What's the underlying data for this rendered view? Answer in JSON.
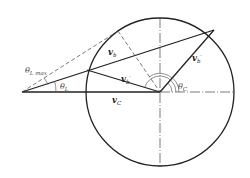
{
  "diagram": {
    "labels": {
      "theta_L_max": {
        "main": "θ",
        "sub": "L max"
      },
      "theta_L": {
        "main": "θ",
        "sub": "L"
      },
      "theta_C": {
        "main": "θ",
        "sub": "C"
      },
      "v_b": {
        "main": "v",
        "sub": "b"
      },
      "v_b_prime_inner": {
        "main": "v",
        "sub": "b",
        "prime": "′"
      },
      "v_b_prime_outer": {
        "main": "v",
        "sub": "b",
        "prime": "′"
      },
      "v_C": {
        "main": "v",
        "sub": "C"
      }
    },
    "colors": {
      "line": "#222222",
      "dash": "#555555",
      "background": "#ffffff"
    }
  }
}
